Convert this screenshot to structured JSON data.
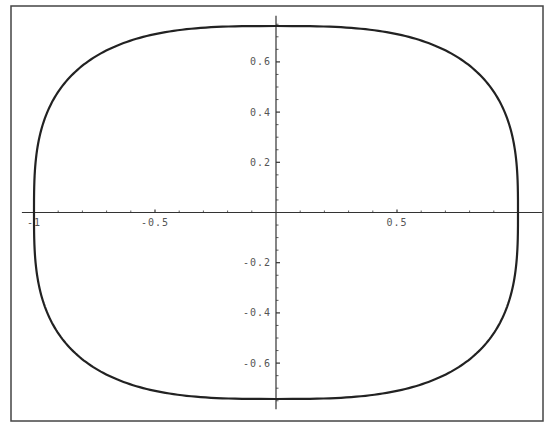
{
  "chart_data": {
    "type": "line",
    "title": "",
    "xlabel": "",
    "ylabel": "",
    "xlim": [
      -1.05,
      1.1
    ],
    "ylim": [
      -0.8,
      0.8
    ],
    "grid": false,
    "legend": null,
    "frame": true,
    "axes_origin": [
      0,
      0
    ],
    "x_ticks": [
      {
        "value": -1,
        "label": "-1"
      },
      {
        "value": -0.5,
        "label": "-0.5"
      },
      {
        "value": 0.5,
        "label": "0.5"
      }
    ],
    "y_ticks": [
      {
        "value": 0.6,
        "label": "0.6"
      },
      {
        "value": 0.4,
        "label": "0.4"
      },
      {
        "value": 0.2,
        "label": "0.2"
      },
      {
        "value": -0.2,
        "label": "-0.2"
      },
      {
        "value": -0.4,
        "label": "-0.4"
      },
      {
        "value": -0.6,
        "label": "-0.6"
      }
    ],
    "x_minor_step": 0.1,
    "y_minor_step": 0.05,
    "series": [
      {
        "name": "curve",
        "shape": "superellipse",
        "x_semi_axis": 1.0,
        "y_semi_axis": 0.743,
        "exponent": 3.0,
        "color": "#222222",
        "points": [
          [
            1.0,
            0.0
          ],
          [
            0.95,
            0.4
          ],
          [
            0.85,
            0.56
          ],
          [
            0.7,
            0.65
          ],
          [
            0.5,
            0.71
          ],
          [
            0.25,
            0.74
          ],
          [
            0.0,
            0.743
          ],
          [
            -0.25,
            0.74
          ],
          [
            -0.5,
            0.71
          ],
          [
            -0.7,
            0.65
          ],
          [
            -0.85,
            0.56
          ],
          [
            -0.95,
            0.4
          ],
          [
            -1.0,
            0.0
          ],
          [
            -0.95,
            -0.4
          ],
          [
            -0.85,
            -0.56
          ],
          [
            -0.7,
            -0.65
          ],
          [
            -0.5,
            -0.71
          ],
          [
            -0.25,
            -0.74
          ],
          [
            0.0,
            -0.743
          ],
          [
            0.25,
            -0.74
          ],
          [
            0.5,
            -0.71
          ],
          [
            0.7,
            -0.65
          ],
          [
            0.85,
            -0.56
          ],
          [
            0.95,
            -0.4
          ],
          [
            1.0,
            0.0
          ]
        ]
      }
    ]
  },
  "layout": {
    "frame": {
      "left": 11,
      "top": 6,
      "right": 543,
      "bottom": 421
    },
    "origin_px": {
      "x": 276,
      "y": 212.5
    },
    "px_per_unit_x": 242,
    "px_per_unit_y": 251
  },
  "colors": {
    "frame": "#444444",
    "axis": "#333333",
    "curve": "#222222",
    "label": "#555555"
  }
}
